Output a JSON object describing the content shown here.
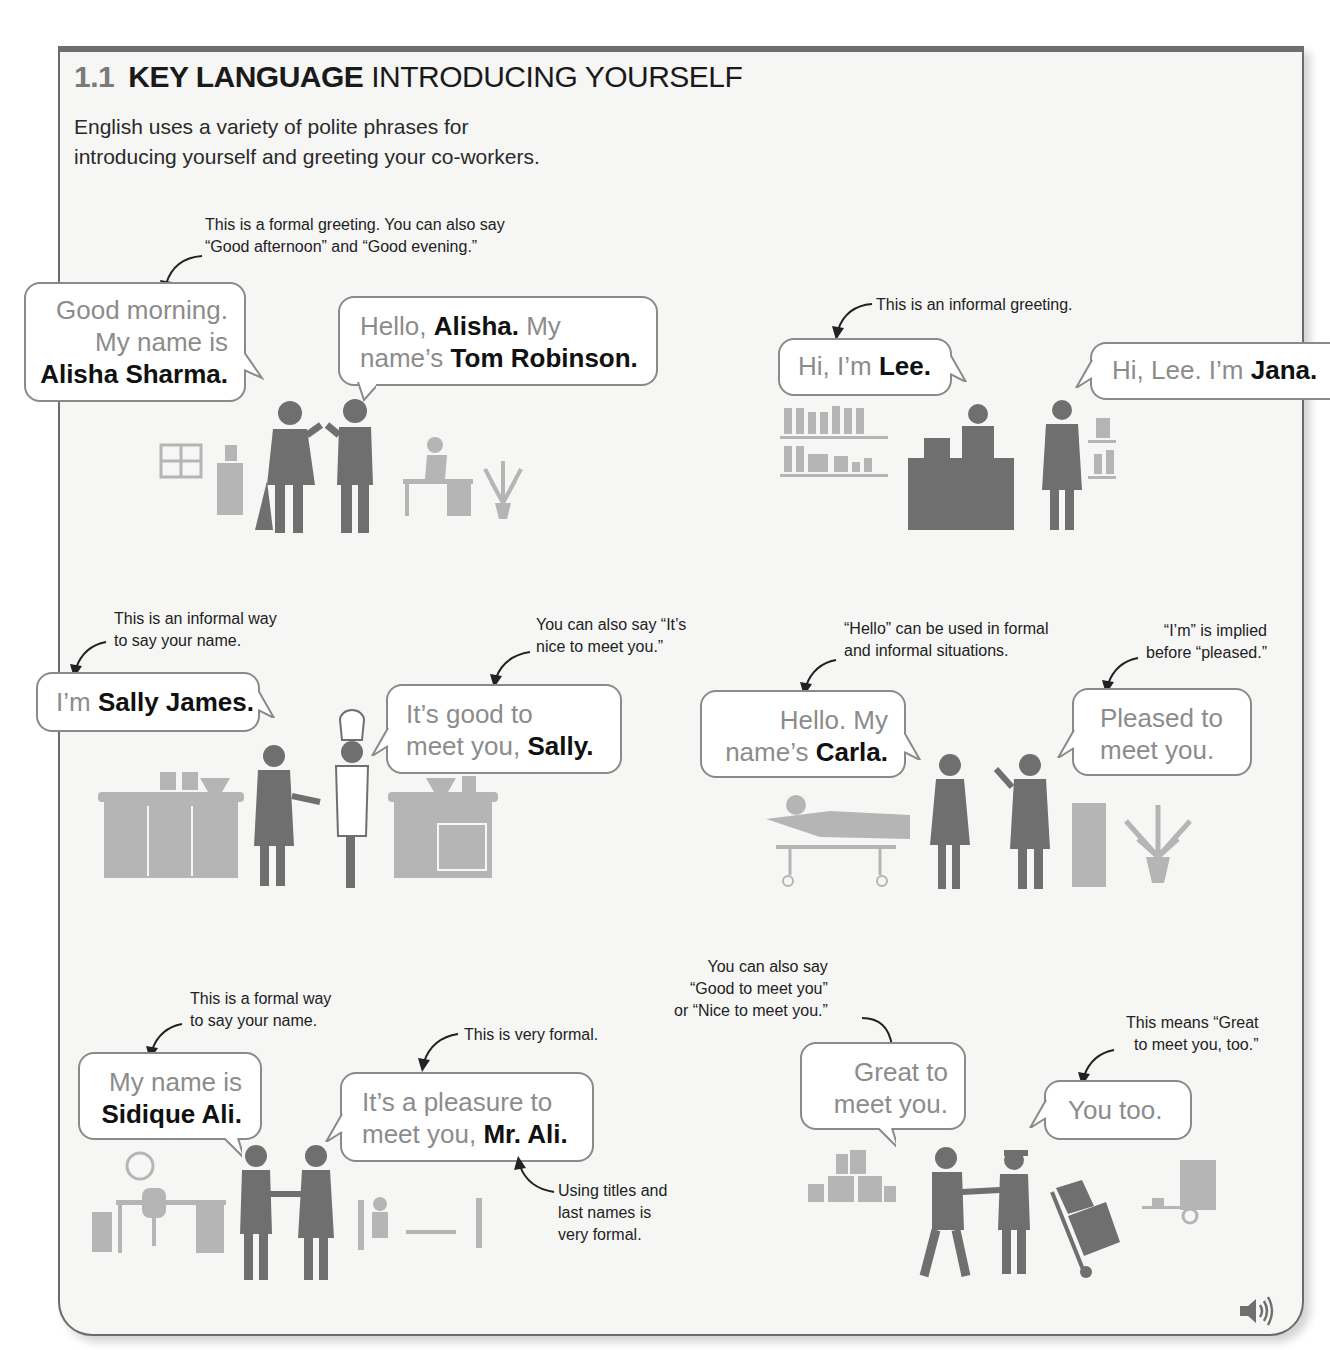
{
  "header": {
    "section_number": "1.1",
    "title_bold": "KEY LANGUAGE",
    "title_rest": "INTRODUCING YOURSELF",
    "intro_line1": "English uses a variety of polite phrases for",
    "intro_line2": "introducing yourself and greeting your co-workers."
  },
  "scenes": {
    "office": {
      "note": [
        "This is a formal greeting. You can also say",
        "“Good afternoon” and “Good evening.”"
      ],
      "bubble1": {
        "l1": "Good morning.",
        "l2": "My name is",
        "l3_bold": "Alisha Sharma."
      },
      "bubble2": {
        "l1_plain": "Hello, ",
        "l1_bold": "Alisha.",
        "l1_after": " My",
        "l2_plain": "name’s ",
        "l2_bold": "Tom Robinson."
      }
    },
    "shop": {
      "note": "This is an informal greeting.",
      "bubble1": {
        "plain": "Hi, I’m ",
        "bold": "Lee."
      },
      "bubble2": {
        "plain": "Hi, Lee. I’m ",
        "bold": "Jana."
      }
    },
    "kitchen": {
      "note1": [
        "This is an informal way",
        "to say your name."
      ],
      "note2": [
        "You can also say “It’s",
        "nice to meet you.”"
      ],
      "bubble1": {
        "plain": "I’m ",
        "bold": "Sally James."
      },
      "bubble2": {
        "l1": "It’s good to",
        "l2_plain": "meet you, ",
        "l2_bold": "Sally."
      }
    },
    "hospital": {
      "note1": [
        "“Hello” can be used in formal",
        "and informal situations."
      ],
      "note2": [
        "“I’m” is implied",
        "before “pleased.”"
      ],
      "bubble1": {
        "l1": "Hello. My",
        "l2_plain": "name’s ",
        "l2_bold": "Carla."
      },
      "bubble2": {
        "l1": "Pleased to",
        "l2": "meet you."
      }
    },
    "formal_office": {
      "note1": [
        "This is a formal way",
        "to say your name."
      ],
      "note2": "This is very formal.",
      "note3": [
        "Using titles and",
        "last names is",
        "very formal."
      ],
      "bubble1": {
        "l1": "My name is",
        "l2_bold": "Sidique Ali."
      },
      "bubble2": {
        "l1": "It’s a pleasure to",
        "l2_plain": "meet you, ",
        "l2_bold": "Mr. Ali."
      }
    },
    "delivery": {
      "note1": [
        "You can also say",
        "“Good to meet you”",
        "or “Nice to meet you.”"
      ],
      "note2": [
        "This means “Great",
        "to meet you, too.”"
      ],
      "bubble1": {
        "l1": "Great to",
        "l2": "meet you."
      },
      "bubble2": {
        "text": "You too."
      }
    }
  },
  "audio": {
    "icon": "speaker-icon"
  },
  "colors": {
    "frame_border": "#6b6b6b",
    "panel_bg": "#f6f6f5",
    "figure_dark": "#6f6f6f",
    "figure_light": "#b3b3b3",
    "muted_text": "#8c8c8c"
  }
}
